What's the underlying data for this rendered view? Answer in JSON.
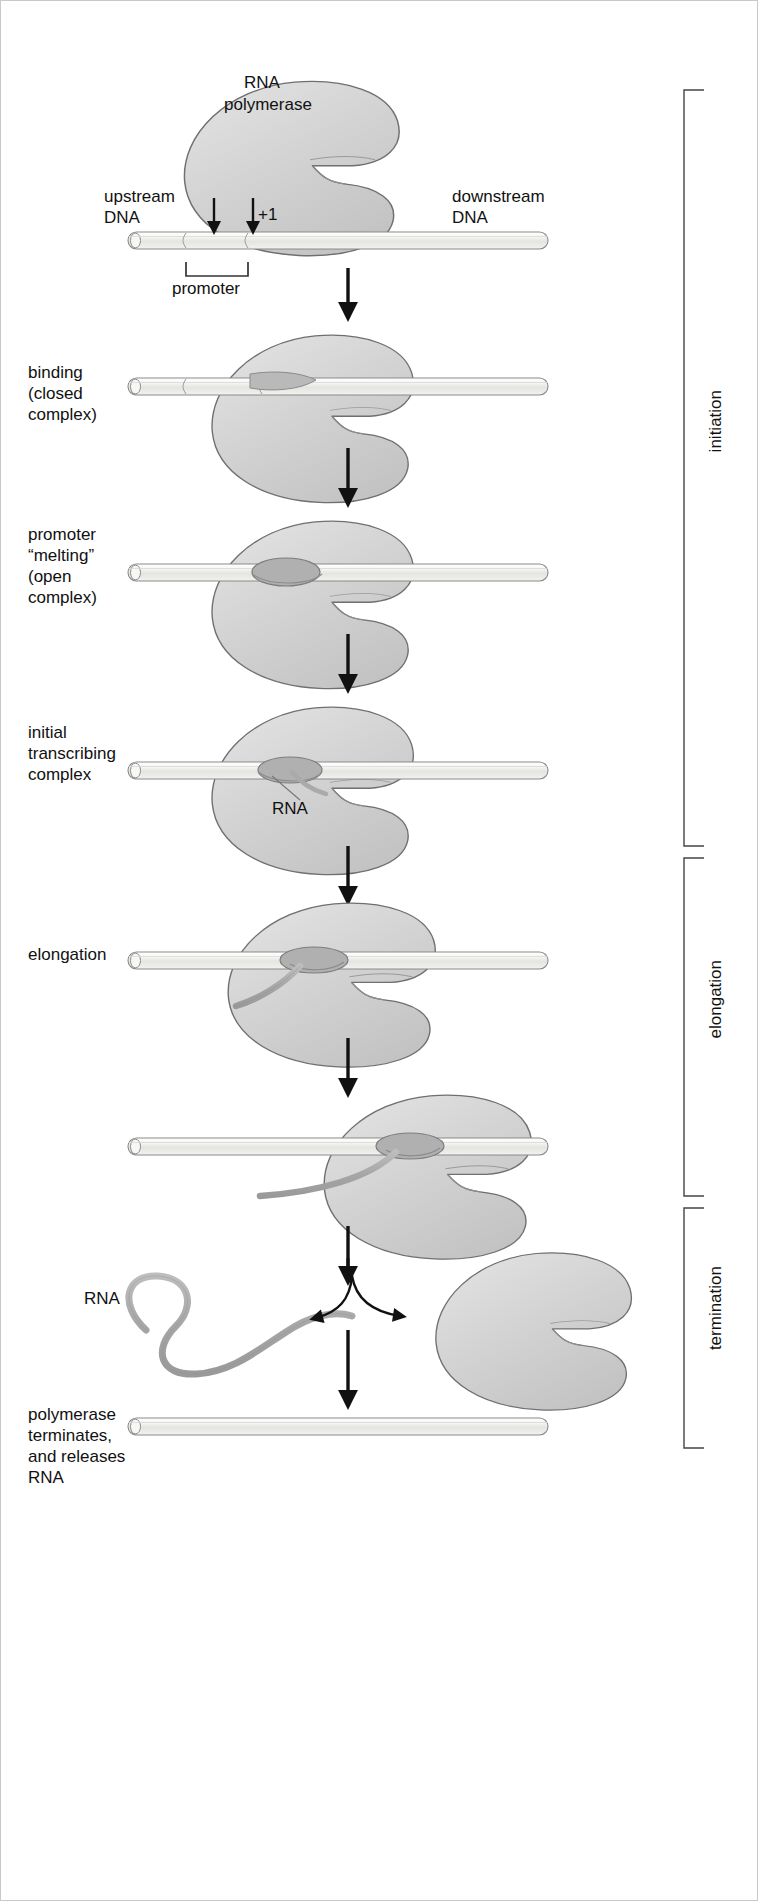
{
  "figure": {
    "type": "process-diagram",
    "background": "#ffffff",
    "colors": {
      "polymerase_fill": "#d2d2d2",
      "polymerase_stroke": "#6e6e6e",
      "polymerase_shadow": "#b4b4b4",
      "dna_fill": "#f0f0ee",
      "dna_stroke": "#8a8a8a",
      "rna_fill": "#a8a8a8",
      "rna_stroke": "#8a8a8a",
      "arrow": "#111111",
      "bracket": "#444444",
      "text": "#111111"
    }
  },
  "annotations": {
    "rna_polymerase_line1": "RNA",
    "rna_polymerase_line2": "polymerase",
    "upstream_line1": "upstream",
    "upstream_line2": "DNA",
    "downstream_line1": "downstream",
    "downstream_line2": "DNA",
    "plus_one": "+1",
    "promoter": "promoter",
    "rna_label_initial": "RNA",
    "rna_label_released": "RNA"
  },
  "steps": [
    {
      "id": "step-1-approach",
      "label_lines": [],
      "caption": ""
    },
    {
      "id": "step-2-binding",
      "label_lines": [
        "binding",
        "(closed",
        "complex)"
      ],
      "caption": "binding (closed complex)"
    },
    {
      "id": "step-3-melting",
      "label_lines": [
        "promoter",
        "“melting”",
        "(open",
        "complex)"
      ],
      "caption": "promoter “melting” (open complex)"
    },
    {
      "id": "step-4-initial-transcribing",
      "label_lines": [
        "initial",
        "transcribing",
        "complex"
      ],
      "caption": "initial transcribing complex"
    },
    {
      "id": "step-5-elongation",
      "label_lines": [
        "elongation"
      ],
      "caption": "elongation"
    },
    {
      "id": "step-6-elongation-continued",
      "label_lines": [],
      "caption": ""
    },
    {
      "id": "step-7-termination",
      "label_lines": [],
      "caption": ""
    },
    {
      "id": "step-8-release",
      "label_lines": [
        "polymerase",
        "terminates,",
        "and releases",
        "RNA"
      ],
      "caption": "polymerase terminates, and releases RNA"
    }
  ],
  "phases": [
    {
      "id": "phase-initiation",
      "label": "initiation",
      "top": 88,
      "bottom": 848
    },
    {
      "id": "phase-elongation",
      "label": "elongation",
      "top": 856,
      "bottom": 1196
    },
    {
      "id": "phase-termination",
      "label": "termination",
      "top": 1204,
      "bottom": 1448
    }
  ]
}
